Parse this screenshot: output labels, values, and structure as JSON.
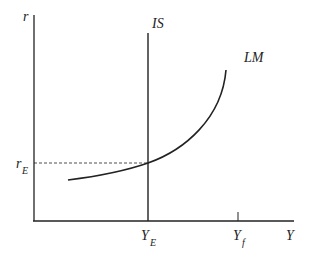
{
  "diagram": {
    "type": "IS-LM",
    "axes": {
      "y_label": "r",
      "x_label": "Y"
    },
    "curves": {
      "is_label": "IS",
      "lm_label": "LM"
    },
    "marks": {
      "r_equilibrium_main": "r",
      "r_equilibrium_sub": "E",
      "y_equilibrium_main": "Y",
      "y_equilibrium_sub": "E",
      "y_full_main": "Y",
      "y_full_sub": "f"
    },
    "colors": {
      "line": "#222222",
      "background": "#ffffff"
    }
  }
}
